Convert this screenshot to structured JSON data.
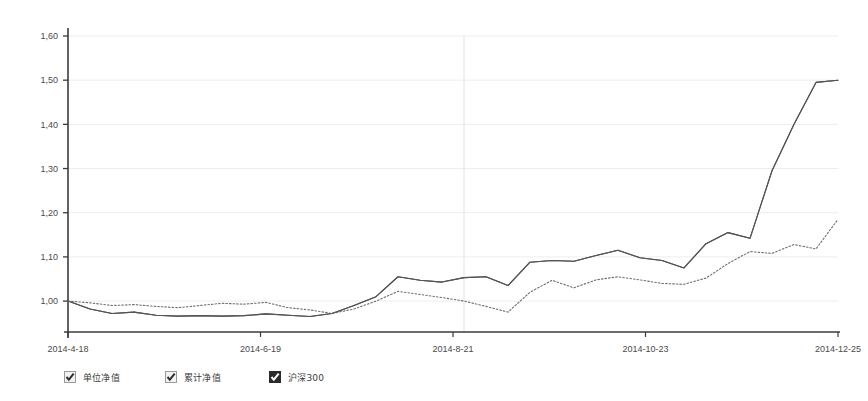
{
  "chart_data": {
    "type": "line",
    "title": "",
    "subtitle": "",
    "xlabel": "",
    "ylabel": "",
    "grid": true,
    "legend_position": "bottom",
    "ylim": [
      0.93,
      1.6
    ],
    "yticks": [
      "1,00",
      "1,10",
      "1,20",
      "1,30",
      "1,40",
      "1,50",
      "1,60"
    ],
    "ytick_values": [
      1.0,
      1.1,
      1.2,
      1.3,
      1.4,
      1.5,
      1.6
    ],
    "xticks": [
      "2014-4-18",
      "2014-6-19",
      "2014-8-21",
      "2014-10-23",
      "2014-12-25"
    ],
    "xtick_positions": [
      0,
      0.25,
      0.5,
      0.75,
      1.0
    ],
    "x": [
      "2014-4-18",
      "2014-4-25",
      "2014-5-2",
      "2014-5-9",
      "2014-5-16",
      "2014-5-23",
      "2014-5-30",
      "2014-6-6",
      "2014-6-13",
      "2014-6-19",
      "2014-6-27",
      "2014-7-4",
      "2014-7-11",
      "2014-7-18",
      "2014-7-25",
      "2014-8-1",
      "2014-8-8",
      "2014-8-15",
      "2014-8-21",
      "2014-8-29",
      "2014-9-5",
      "2014-9-12",
      "2014-9-19",
      "2014-9-26",
      "2014-10-10",
      "2014-10-17",
      "2014-10-23",
      "2014-10-31",
      "2014-11-7",
      "2014-11-14",
      "2014-11-21",
      "2014-11-28",
      "2014-12-5",
      "2014-12-12",
      "2014-12-19",
      "2014-12-25"
    ],
    "series": [
      {
        "name": "单位净值",
        "style": "solid",
        "color": "#4a4a4a",
        "values": [
          1.0,
          0.982,
          0.972,
          0.975,
          0.968,
          0.966,
          0.967,
          0.966,
          0.967,
          0.971,
          0.968,
          0.965,
          0.972,
          0.99,
          1.01,
          1.055,
          1.047,
          1.043,
          1.053,
          1.055,
          1.035,
          1.088,
          1.092,
          1.09,
          1.103,
          1.115,
          1.098,
          1.092,
          1.075,
          1.13,
          1.155,
          1.142,
          1.295,
          1.4,
          1.495,
          1.5
        ]
      },
      {
        "name": "累计净值",
        "style": "solid",
        "color": "#555555",
        "values": [
          1.0,
          0.982,
          0.972,
          0.975,
          0.968,
          0.966,
          0.967,
          0.966,
          0.967,
          0.971,
          0.968,
          0.965,
          0.972,
          0.99,
          1.01,
          1.055,
          1.047,
          1.043,
          1.053,
          1.055,
          1.035,
          1.088,
          1.092,
          1.09,
          1.103,
          1.115,
          1.098,
          1.092,
          1.075,
          1.13,
          1.155,
          1.142,
          1.295,
          1.4,
          1.495,
          1.5
        ]
      },
      {
        "name": "沪深300",
        "style": "dotted",
        "color": "#6e6e6e",
        "values": [
          1.0,
          0.996,
          0.99,
          0.992,
          0.988,
          0.985,
          0.99,
          0.995,
          0.993,
          0.997,
          0.985,
          0.98,
          0.972,
          0.982,
          1.0,
          1.022,
          1.015,
          1.008,
          1.0,
          0.988,
          0.975,
          1.02,
          1.047,
          1.03,
          1.048,
          1.055,
          1.048,
          1.04,
          1.038,
          1.052,
          1.085,
          1.112,
          1.108,
          1.128,
          1.118,
          1.185
        ]
      }
    ],
    "vertical_gridline_at": "2014-8-21"
  },
  "legend": {
    "items": [
      {
        "label": "单位净值",
        "checked": true,
        "style": "light"
      },
      {
        "label": "累计净值",
        "checked": true,
        "style": "light"
      },
      {
        "label": "沪深300",
        "checked": true,
        "style": "dark"
      }
    ]
  },
  "colors": {
    "axis": "#3b3b3b",
    "grid": "#ededed",
    "background": "#ffffff",
    "text": "#3c3c3c"
  }
}
